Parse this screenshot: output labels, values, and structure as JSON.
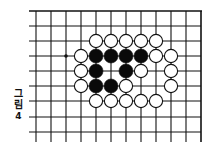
{
  "figure": {
    "caption_chars": [
      "그",
      "림",
      "4"
    ],
    "caption": "그림 4"
  },
  "board": {
    "line_color": "#111111",
    "background": "#ffffff",
    "grid": {
      "x_lines": [
        36,
        51,
        66,
        81,
        96,
        111,
        126,
        141,
        156,
        171,
        186,
        201
      ],
      "y_lines": [
        11,
        26,
        41,
        56,
        71,
        86,
        101,
        117,
        132
      ],
      "left_extent": 29,
      "bottom_extent": 142,
      "border_right_x": 201,
      "border_top_y": 11
    },
    "star_points": [
      {
        "col": 2,
        "row": 3
      }
    ],
    "stones": [
      {
        "col": 4,
        "row": 2,
        "color": "white"
      },
      {
        "col": 5,
        "row": 2,
        "color": "white"
      },
      {
        "col": 6,
        "row": 2,
        "color": "white"
      },
      {
        "col": 7,
        "row": 2,
        "color": "white"
      },
      {
        "col": 8,
        "row": 2,
        "color": "white"
      },
      {
        "col": 3,
        "row": 3,
        "color": "white"
      },
      {
        "col": 4,
        "row": 3,
        "color": "black"
      },
      {
        "col": 5,
        "row": 3,
        "color": "black"
      },
      {
        "col": 6,
        "row": 3,
        "color": "black"
      },
      {
        "col": 7,
        "row": 3,
        "color": "black"
      },
      {
        "col": 8,
        "row": 3,
        "color": "white"
      },
      {
        "col": 9,
        "row": 3,
        "color": "white"
      },
      {
        "col": 3,
        "row": 4,
        "color": "white"
      },
      {
        "col": 4,
        "row": 4,
        "color": "black"
      },
      {
        "col": 6,
        "row": 4,
        "color": "black"
      },
      {
        "col": 7,
        "row": 4,
        "color": "white"
      },
      {
        "col": 9,
        "row": 4,
        "color": "white"
      },
      {
        "col": 3,
        "row": 5,
        "color": "white"
      },
      {
        "col": 4,
        "row": 5,
        "color": "black"
      },
      {
        "col": 5,
        "row": 5,
        "color": "black"
      },
      {
        "col": 6,
        "row": 5,
        "color": "white"
      },
      {
        "col": 9,
        "row": 5,
        "color": "white"
      },
      {
        "col": 4,
        "row": 6,
        "color": "white"
      },
      {
        "col": 5,
        "row": 6,
        "color": "white"
      },
      {
        "col": 6,
        "row": 6,
        "color": "white"
      },
      {
        "col": 7,
        "row": 6,
        "color": "white"
      },
      {
        "col": 8,
        "row": 6,
        "color": "white"
      }
    ],
    "stone_radius": 7,
    "counts": {
      "black": 9,
      "white": 18
    }
  }
}
